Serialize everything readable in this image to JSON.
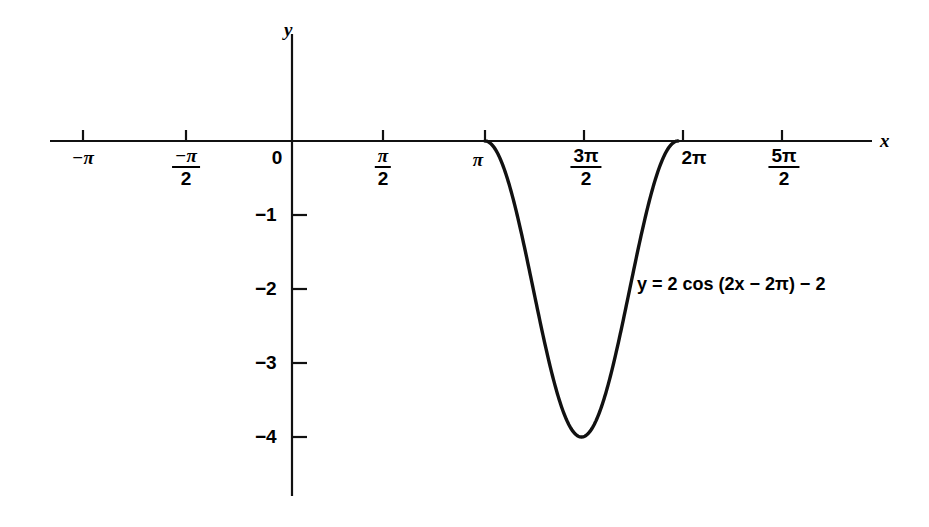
{
  "chart_data": {
    "type": "line",
    "title": "",
    "xlabel": "x",
    "ylabel": "y",
    "equation": "y = 2 cos (2x − 2π) − 2",
    "equation_parts": {
      "lhs": "y",
      "equals": "=",
      "rhs": "2 cos (2x − 2π) − 2"
    },
    "grid": false,
    "legend": "none",
    "xlim": [
      -3.5416,
      8.9012
    ],
    "ylim": [
      -4.78,
      1.5
    ],
    "x_ticks": [
      {
        "value": -3.14159,
        "label": "−π",
        "type": "plain"
      },
      {
        "value": -1.5708,
        "label": "−π/2",
        "type": "fraction",
        "num": "−π",
        "den": "2"
      },
      {
        "value": 0,
        "label": "0",
        "type": "plain"
      },
      {
        "value": 1.5708,
        "label": "π/2",
        "type": "fraction",
        "num": "π",
        "den": "2"
      },
      {
        "value": 3.14159,
        "label": "π",
        "type": "plain"
      },
      {
        "value": 4.71239,
        "label": "3π/2",
        "type": "fraction",
        "num": "3π",
        "den": "2"
      },
      {
        "value": 6.28319,
        "label": "2π",
        "type": "plain"
      },
      {
        "value": 7.85398,
        "label": "5π/2",
        "type": "fraction",
        "num": "5π",
        "den": "2"
      }
    ],
    "y_ticks": [
      {
        "value": -1,
        "label": "−1"
      },
      {
        "value": -2,
        "label": "−2"
      },
      {
        "value": -3,
        "label": "−3"
      },
      {
        "value": -4,
        "label": "−4"
      }
    ],
    "series": [
      {
        "name": "y = 2 cos (2x − 2π) − 2",
        "color": "#111111",
        "amplitude": 2,
        "period": 3.14159,
        "vertical_shift": -2,
        "phase_shift": 3.14159,
        "domain": [
          3.14159,
          6.28319
        ],
        "minimum": {
          "x": 4.71239,
          "y": -4
        },
        "zeros": [
          3.14159,
          6.28319
        ],
        "points": [
          {
            "x": 3.14159,
            "y": 0.0
          },
          {
            "x": 3.3378,
            "y": -0.1522
          },
          {
            "x": 3.53429,
            "y": -0.5858
          },
          {
            "x": 3.73064,
            "y": -1.2346
          },
          {
            "x": 3.92699,
            "y": -2.0
          },
          {
            "x": 4.12334,
            "y": -2.7654
          },
          {
            "x": 4.31969,
            "y": -3.4142
          },
          {
            "x": 4.51604,
            "y": -3.8478
          },
          {
            "x": 4.71239,
            "y": -4.0
          },
          {
            "x": 4.90874,
            "y": -3.8478
          },
          {
            "x": 5.10509,
            "y": -3.4142
          },
          {
            "x": 5.30144,
            "y": -2.7654
          },
          {
            "x": 5.49779,
            "y": -2.0
          },
          {
            "x": 5.69414,
            "y": -1.2346
          },
          {
            "x": 5.89049,
            "y": -0.5858
          },
          {
            "x": 6.08684,
            "y": -0.1522
          },
          {
            "x": 6.28319,
            "y": 0.0
          }
        ]
      }
    ],
    "annotations": [
      {
        "text": "y = 2 cos (2x − 2π) − 2",
        "x": 7.0,
        "y": -2.22
      }
    ]
  },
  "axes": {
    "x_axis_name": "x",
    "y_axis_name": "y",
    "origin_label": "0"
  }
}
